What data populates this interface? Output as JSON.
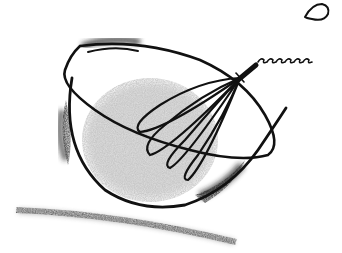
{
  "illustration": {
    "subject": "whisk in a mixing bowl",
    "style": "hand-drawn ink with graphite shading",
    "colors": {
      "background": "#ffffff",
      "ink": "#111111",
      "shading_light": "#b8b8b8",
      "shading_dark": "#3a3a3a"
    },
    "elements": [
      "bowl",
      "whisk",
      "bowl-shadow",
      "ground-stroke",
      "gray-fill"
    ]
  }
}
